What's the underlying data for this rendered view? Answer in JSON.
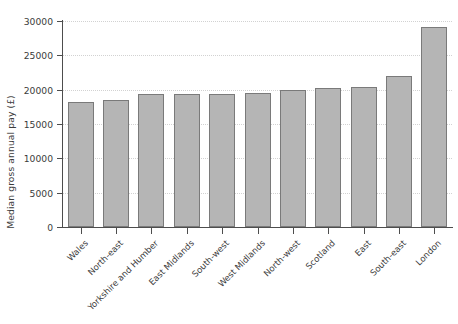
{
  "chart_data": {
    "type": "bar",
    "title": "",
    "xlabel": "",
    "ylabel": "Median gross annual pay (£)",
    "categories": [
      "Wales",
      "North-east",
      "Yorkshire and Humber",
      "East Midlands",
      "South-west",
      "West Midlands",
      "North-west",
      "Scotland",
      "East",
      "South-east",
      "London"
    ],
    "values": [
      18200,
      18500,
      19400,
      19400,
      19400,
      19500,
      19900,
      20200,
      20400,
      22000,
      29200
    ],
    "ylim": [
      0,
      30000
    ],
    "yticks": [
      0,
      5000,
      10000,
      15000,
      20000,
      25000,
      30000
    ],
    "ytick_labels": [
      "0",
      "5000",
      "10000",
      "15000",
      "20000",
      "25000",
      "30000"
    ],
    "grid": "horizontal-dotted",
    "legend": "none",
    "bar_fill": "#b5b5b5",
    "bar_border": "#7a7a7a",
    "axis_color": "#4d4d4d",
    "grid_color": "#d2d2d2",
    "background": "#ffffff"
  }
}
